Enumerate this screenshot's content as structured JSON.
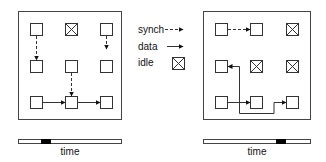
{
  "legend": {
    "synch": "synch",
    "data": "data",
    "idle": "idle"
  },
  "left_panel": {
    "time_label": "time",
    "timeline_marker": {
      "start_frac": 0.22,
      "end_frac": 0.32
    }
  },
  "right_panel": {
    "time_label": "time",
    "timeline_marker": {
      "start_frac": 0.68,
      "end_frac": 0.77
    }
  },
  "colors": {
    "stroke": "#333333",
    "marker": "#000000",
    "background": "#ffffff"
  }
}
